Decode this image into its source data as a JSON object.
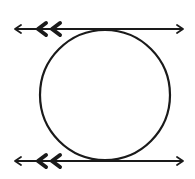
{
  "diagram": {
    "stroke_color": "#1a1a1a",
    "background": "#ffffff",
    "circle": {
      "cx": 105,
      "cy": 95,
      "r": 65
    },
    "lines": [
      {
        "name": "top-tangent-line",
        "y": 29,
        "x1": 15,
        "x2": 183,
        "parallel_marks": 2
      },
      {
        "name": "bottom-tangent-line",
        "y": 161,
        "x1": 15,
        "x2": 183,
        "parallel_marks": 2
      }
    ]
  }
}
